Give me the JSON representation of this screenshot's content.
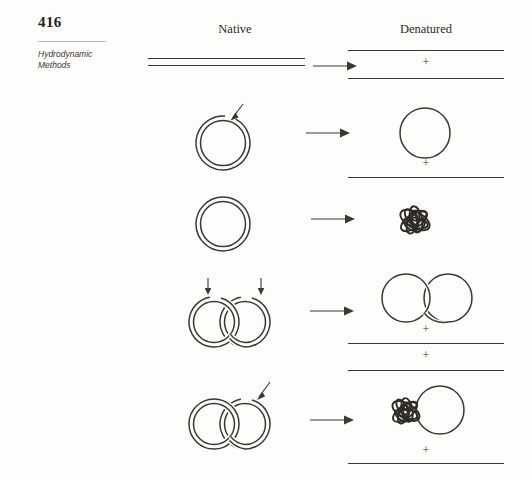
{
  "page": {
    "number": "416",
    "running_head_line1": "Hydrodynamic",
    "running_head_line2": "Methods",
    "background_color": "#fdfdfb",
    "ink_color": "#3b382f"
  },
  "columns": {
    "left_label": "Native",
    "right_label": "Denatured"
  },
  "symbols": {
    "plus": "+",
    "arrow": "→"
  },
  "rows": [
    {
      "id": "linear-duplex",
      "native": {
        "form": "linear duplex DNA",
        "description": "two parallel straight strands (double helix drawn as two lines)",
        "nicks": 0
      },
      "denatured": {
        "description": "two separated linear single strands",
        "products": [
          "linear single strand",
          "linear single strand"
        ],
        "separators": [
          "+"
        ]
      }
    },
    {
      "id": "nicked-circle",
      "native": {
        "form": "nicked circular duplex DNA",
        "description": "double-line circle with one nick marked by an arrow",
        "nicks": 1
      },
      "denatured": {
        "description": "one intact single-strand circle plus one linear single strand",
        "products": [
          "single-strand circle",
          "linear single strand"
        ],
        "separators": [
          "+"
        ]
      }
    },
    {
      "id": "closed-circle",
      "native": {
        "form": "covalently closed circular duplex DNA",
        "description": "double-line circle with no nick",
        "nicks": 0
      },
      "denatured": {
        "description": "collapsed, tangled denatured circular duplex",
        "products": [
          "collapsed tangled coil"
        ],
        "separators": []
      }
    },
    {
      "id": "catenane-both-nicked",
      "native": {
        "form": "catenated (interlocked) circular duplexes, both nicked",
        "description": "two interlocked double-line circles, each with a nick arrow",
        "nicks": 2
      },
      "denatured": {
        "description": "two interlocked single-strand circles plus two linear single strands",
        "products": [
          "two interlocked single-strand circles",
          "linear single strand",
          "linear single strand"
        ],
        "separators": [
          "+",
          "+"
        ]
      }
    },
    {
      "id": "catenane-one-nicked",
      "native": {
        "form": "catenated circular duplexes, one nicked",
        "description": "two interlocked double-line circles, right one carries a nick arrow",
        "nicks": 1
      },
      "denatured": {
        "description": "collapsed tangled coil interlocked with an open single-strand circle, plus one linear single strand",
        "products": [
          "collapsed coil interlocked with single-strand circle",
          "linear single strand"
        ],
        "separators": [
          "+"
        ]
      }
    }
  ]
}
